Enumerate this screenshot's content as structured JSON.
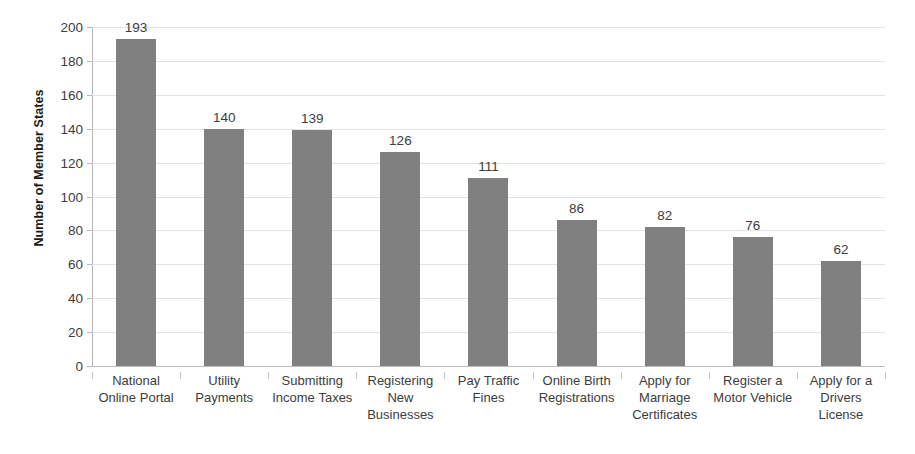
{
  "chart_data": {
    "type": "bar",
    "title": "",
    "subtitle": "",
    "xlabel": "",
    "ylabel": "Number of Member States",
    "ylim": [
      0,
      200
    ],
    "ytick_step": 20,
    "yticks": [
      0,
      20,
      40,
      60,
      80,
      100,
      120,
      140,
      160,
      180,
      200
    ],
    "ytick_labels": [
      "0",
      "20",
      "40",
      "60",
      "80",
      "100",
      "120",
      "140",
      "160",
      "180",
      "200"
    ],
    "grid": true,
    "grid_axis": "y",
    "legend": false,
    "legend_position": "none",
    "show_data_labels": true,
    "bar_color": "#808080",
    "gridline_color": "#e3e3e3",
    "axis_color": "#b5b5b5",
    "text_color": "#3d3d3d",
    "background_color": "#ffffff",
    "categories": [
      "National Online Portal",
      "Utility Payments",
      "Submitting Income Taxes",
      "Registering New Businesses",
      "Pay Traffic Fines",
      "Online Birth Registrations",
      "Apply for Marriage Certificates",
      "Register a Motor Vehicle",
      "Apply for a Drivers License"
    ],
    "category_lines": [
      [
        "National",
        "Online Portal"
      ],
      [
        "Utility",
        "Payments"
      ],
      [
        "Submitting",
        "Income Taxes"
      ],
      [
        "Registering",
        "New",
        "Businesses"
      ],
      [
        "Pay Traffic",
        "Fines"
      ],
      [
        "Online Birth",
        "Registrations"
      ],
      [
        "Apply for",
        "Marriage",
        "Certificates"
      ],
      [
        "Register a",
        "Motor Vehicle"
      ],
      [
        "Apply for a",
        "Drivers",
        "License"
      ]
    ],
    "values": [
      193,
      140,
      139,
      126,
      111,
      86,
      82,
      76,
      62
    ],
    "value_labels": [
      "193",
      "140",
      "139",
      "126",
      "111",
      "86",
      "82",
      "76",
      "62"
    ]
  }
}
